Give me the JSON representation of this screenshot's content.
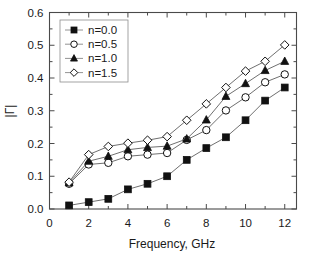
{
  "chart_data": {
    "type": "line",
    "title": "",
    "subtitle": "",
    "xlabel": "Frequency, GHz",
    "ylabel": "|Γ|",
    "xlim": [
      0,
      12.6
    ],
    "ylim": [
      0.0,
      0.6
    ],
    "xticks": [
      0,
      2,
      4,
      6,
      8,
      10,
      12
    ],
    "xtick_labels": [
      "0",
      "2",
      "4",
      "6",
      "8",
      "10",
      "12"
    ],
    "x_minor_ticks": [
      1,
      3,
      5,
      7,
      9,
      11
    ],
    "yticks": [
      0.0,
      0.1,
      0.2,
      0.3,
      0.4,
      0.5,
      0.6
    ],
    "ytick_labels": [
      "0.0",
      "0.1",
      "0.2",
      "0.3",
      "0.4",
      "0.5",
      "0.6"
    ],
    "y_minor_ticks": [
      0.05,
      0.15,
      0.25,
      0.35,
      0.45,
      0.55
    ],
    "grid": false,
    "legend_position": "top-left",
    "x": [
      1,
      2,
      3,
      4,
      5,
      6,
      7,
      8,
      9,
      10,
      11,
      12
    ],
    "series": [
      {
        "name": "n=0.0",
        "marker": "filled-square",
        "values": [
          0.011,
          0.021,
          0.031,
          0.06,
          0.077,
          0.1,
          0.15,
          0.186,
          0.219,
          0.271,
          0.331,
          0.371
        ]
      },
      {
        "name": "n=0.5",
        "marker": "open-circle",
        "values": [
          0.077,
          0.136,
          0.141,
          0.161,
          0.166,
          0.171,
          0.211,
          0.241,
          0.301,
          0.341,
          0.387,
          0.411
        ]
      },
      {
        "name": "n=1.0",
        "marker": "filled-triangle",
        "values": [
          0.08,
          0.146,
          0.161,
          0.181,
          0.188,
          0.192,
          0.214,
          0.272,
          0.344,
          0.383,
          0.423,
          0.451
        ]
      },
      {
        "name": "n=1.5",
        "marker": "open-diamond",
        "values": [
          0.082,
          0.166,
          0.191,
          0.201,
          0.21,
          0.221,
          0.271,
          0.321,
          0.371,
          0.421,
          0.451,
          0.501
        ]
      }
    ],
    "colors": {
      "axis": "#4a4a4a",
      "line": "#555555",
      "marker_fill": "#111111",
      "marker_open_fill": "#ffffff",
      "text": "#1a1a1a",
      "background": "#ffffff"
    }
  },
  "legend": {
    "entries": [
      {
        "label": "n=0.0"
      },
      {
        "label": "n=0.5"
      },
      {
        "label": "n=1.0"
      },
      {
        "label": "n=1.5"
      }
    ]
  }
}
